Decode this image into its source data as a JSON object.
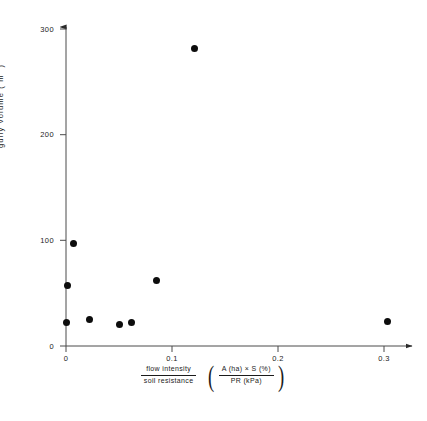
{
  "chart_data": {
    "type": "scatter",
    "title": "",
    "xlabel": "flow intensity / soil resistance ( A(ha) x S (%) / PR (kPa) )",
    "ylabel": "gully volume ( m3 )",
    "xlim": [
      0,
      0.34
    ],
    "ylim": [
      0,
      310
    ],
    "grid": false,
    "legend": null,
    "x": [
      0.0,
      0.001,
      0.007,
      0.022,
      0.05,
      0.062,
      0.085,
      0.121,
      0.303
    ],
    "y": [
      20,
      55,
      95,
      23,
      18,
      20,
      60,
      280,
      21
    ],
    "points": [
      {
        "x": 0.0,
        "y": 20
      },
      {
        "x": 0.001,
        "y": 55
      },
      {
        "x": 0.007,
        "y": 95
      },
      {
        "x": 0.022,
        "y": 23
      },
      {
        "x": 0.05,
        "y": 18
      },
      {
        "x": 0.062,
        "y": 20
      },
      {
        "x": 0.085,
        "y": 60
      },
      {
        "x": 0.121,
        "y": 280
      },
      {
        "x": 0.303,
        "y": 21
      }
    ],
    "xticks": [
      0,
      0.1,
      0.2,
      0.3
    ],
    "xtick_labels": [
      "0",
      "0.1",
      "0.2",
      "0.3"
    ],
    "yticks": [
      0,
      100,
      200,
      300
    ],
    "ytick_labels": [
      "0",
      "100",
      "200",
      "300"
    ],
    "marker": "filled-circle",
    "marker_color": "#0d0d0d"
  },
  "axes": {
    "y_axis_title_main": "gully  volume  ( m",
    "y_axis_title_exp": "3",
    "y_axis_title_close": " )"
  },
  "x_caption": {
    "frac1_num": "flow  intensity",
    "frac1_den": "soil resistance",
    "paren_left": "(",
    "frac2_num": "A (ha)  ×  S (%)",
    "frac2_den": "PR (kPa)",
    "paren_right": ")"
  }
}
